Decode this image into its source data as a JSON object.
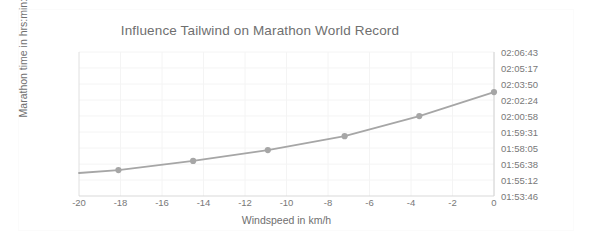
{
  "chart_data": {
    "type": "line",
    "title": "Influence Tailwind on Marathon World Record",
    "xlabel": "Windspeed in km/h",
    "ylabel": "Marathon time in hrs:min:sec",
    "xlim": [
      -20,
      0
    ],
    "ylim_labels": [
      "01:53:46",
      "02:06:43"
    ],
    "grid": true,
    "legend": "none",
    "x_ticks": [
      "-20",
      "-18",
      "-16",
      "-14",
      "-12",
      "-10",
      "-8",
      "-6",
      "-4",
      "-2",
      "0"
    ],
    "x_tick_values": [
      -20,
      -18,
      -16,
      -14,
      -12,
      -10,
      -8,
      -6,
      -4,
      -2,
      0
    ],
    "y_ticks": [
      "02:06:43",
      "02:05:17",
      "02:03:50",
      "02:02:24",
      "02:00:58",
      "01:59:31",
      "01:58:05",
      "01:56:38",
      "01:55:12",
      "01:53:46"
    ],
    "y_tick_seconds": [
      7603,
      7517,
      7430,
      7344,
      7258,
      7171,
      7085,
      6998,
      6912,
      6826
    ],
    "series": [
      {
        "name": "Marathon time vs windspeed",
        "x": [
          -20.0,
          -18.1,
          -14.5,
          -10.9,
          -7.2,
          -3.6,
          0.0
        ],
        "y_labels": [
          "01:55:50",
          "01:56:06",
          "01:56:55",
          "01:57:54",
          "01:59:09",
          "02:00:57",
          "02:03:07"
        ],
        "y_seconds": [
          6950,
          6966,
          7015,
          7074,
          7149,
          7257,
          7387
        ],
        "markers": [
          false,
          true,
          true,
          true,
          true,
          true,
          true
        ],
        "line_color": "#a6a6a6",
        "marker_color": "#a6a6a6"
      }
    ],
    "colors": {
      "line": "#a6a6a6",
      "marker": "#a6a6a6",
      "axis": "#d9d9d9",
      "grid": "#f4f4f4",
      "text": "#787878",
      "title_text": "#6f6f6f",
      "background": "#ffffff"
    }
  }
}
